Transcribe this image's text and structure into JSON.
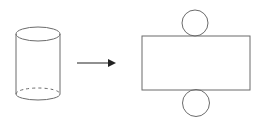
{
  "diagram": {
    "colors": {
      "background": "#ffffff",
      "stroke": "#6b6b6b",
      "arrow": "#222222"
    },
    "cylinder": {
      "cx": 38,
      "top_cy": 34,
      "bottom_cy": 94,
      "rx": 22,
      "ry": 7
    },
    "arrow": {
      "x1": 77,
      "x2": 116,
      "y": 63
    },
    "net": {
      "rect": {
        "x": 142,
        "y": 36,
        "width": 108,
        "height": 54
      },
      "top_circle": {
        "cx": 195,
        "cy": 23,
        "r": 13
      },
      "bottom_circle": {
        "cx": 196,
        "cy": 103,
        "r": 13.5
      }
    }
  }
}
